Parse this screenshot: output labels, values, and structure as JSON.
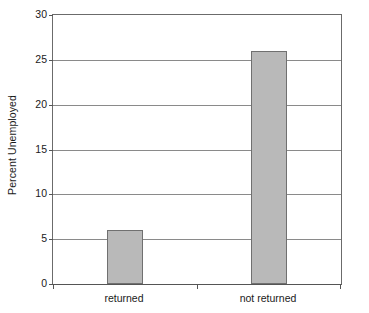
{
  "chart_data": {
    "type": "bar",
    "title": "",
    "subtitle": "",
    "xlabel": "",
    "ylabel": "Percent Unemployed",
    "categories": [
      "returned",
      "not returned"
    ],
    "values": [
      6,
      26
    ],
    "series": [
      {
        "name": "Percent Unemployed",
        "values": [
          6,
          26
        ]
      }
    ],
    "ylim": [
      0,
      30
    ],
    "yticks": [
      0,
      5,
      10,
      15,
      20,
      25,
      30
    ],
    "ytick_labels": [
      "0",
      "5",
      "10",
      "15",
      "20",
      "25",
      "30"
    ],
    "grid": "horizontal",
    "legend": "none",
    "annotations": [],
    "colors": {
      "bar_fill": "#b9b9b9",
      "bar_edge": "#707070",
      "gridline": "#8a8a8a",
      "axis": "#555555",
      "background": "#ffffff",
      "text": "#1a1a1a"
    }
  }
}
